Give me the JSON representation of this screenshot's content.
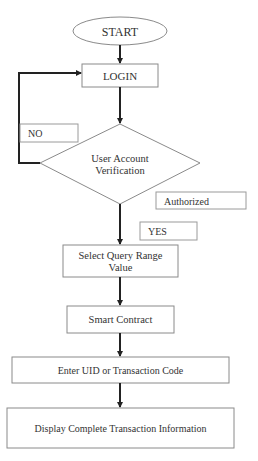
{
  "diagram": {
    "type": "flowchart",
    "nodes": {
      "start": {
        "label": "START",
        "shape": "ellipse"
      },
      "login": {
        "label": "LOGIN",
        "shape": "rect"
      },
      "verify": {
        "line1": "User Account",
        "line2": "Verification",
        "shape": "diamond"
      },
      "select": {
        "line1": "Select Query Range",
        "line2": "Value",
        "shape": "rect"
      },
      "contract": {
        "label": "Smart Contract",
        "shape": "rect"
      },
      "enter": {
        "label": "Enter UID or Transaction Code",
        "shape": "rect"
      },
      "display": {
        "label": "Display Complete Transaction Information",
        "shape": "rect"
      }
    },
    "edge_labels": {
      "no": "NO",
      "authorized": "Authorized",
      "yes": "YES"
    },
    "edges": [
      {
        "from": "start",
        "to": "login"
      },
      {
        "from": "login",
        "to": "verify"
      },
      {
        "from": "verify",
        "to": "login",
        "label": "NO"
      },
      {
        "from": "verify",
        "to": "select",
        "label": "YES / Authorized"
      },
      {
        "from": "select",
        "to": "contract"
      },
      {
        "from": "contract",
        "to": "enter"
      },
      {
        "from": "enter",
        "to": "display"
      }
    ],
    "colors": {
      "line": "#222222",
      "border": "#8a8a8a",
      "text": "#333333",
      "background": "#ffffff"
    }
  }
}
